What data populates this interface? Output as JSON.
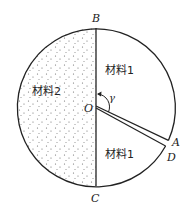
{
  "diagram": {
    "type": "circle-with-wedge-slit",
    "points": {
      "B": "B",
      "C": "C",
      "O": "O",
      "A": "A",
      "D": "D"
    },
    "angle_label": "γ",
    "regions": {
      "upper_right": "材料1",
      "lower_right": "材料1",
      "left": "材料2"
    },
    "colors": {
      "stroke": "#222222",
      "dots": "#666666",
      "background": "#ffffff"
    }
  }
}
